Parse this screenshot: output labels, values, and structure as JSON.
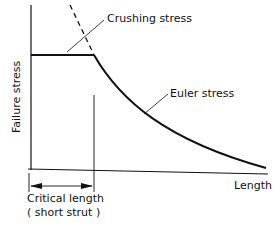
{
  "diagram": {
    "labels": {
      "crushing": "Crushing stress",
      "euler": "Euler stress",
      "ylabel": "Failure stress",
      "xlabel": "Length",
      "critical_line1": "Critical length",
      "critical_line2": "( short strut )"
    },
    "colors": {
      "ink": "#111111",
      "background": "#ffffff"
    }
  }
}
